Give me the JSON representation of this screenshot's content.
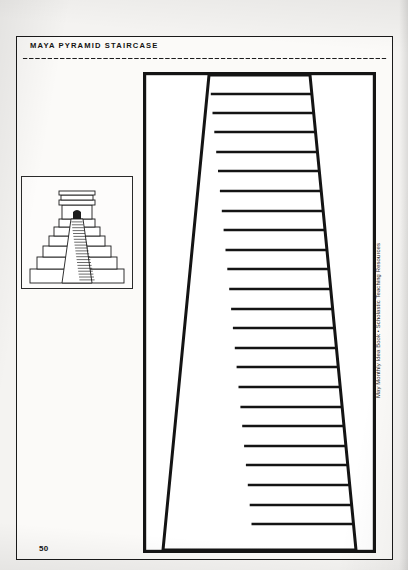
{
  "page": {
    "title": "MAYA PYRAMID STAIRCASE",
    "page_number": "50",
    "credit": "May Monthly Idea Book • Scholastic Teaching Resources",
    "background_color": "#f4f3f1",
    "ink_color": "#1a1a1a",
    "paper_color": "#fbfaf8"
  },
  "separator": {
    "style": "dotted-rule"
  },
  "thumbnail": {
    "label": "maya-pyramid-illustration",
    "description": "Stepped Maya pyramid with temple on top and central staircase",
    "tier_count": 6,
    "stair_rung_count": 22
  },
  "staircase": {
    "label": "maya-pyramid-staircase-template",
    "description": "Perspective drawing of a staircase narrowing toward the top",
    "step_count": 24,
    "top_inner_width_px": 100,
    "bottom_inner_width_px": 208,
    "outer_box": {
      "x": 0,
      "y": 0,
      "width": 233,
      "height": 481
    },
    "line_color": "#141414"
  }
}
